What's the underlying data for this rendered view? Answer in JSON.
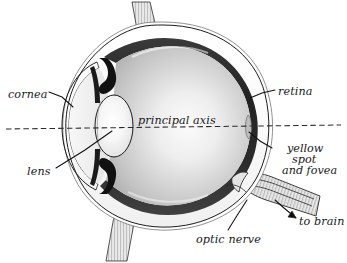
{
  "diagram": {
    "axis_label": "principal axis",
    "labels": {
      "cornea": "cornea",
      "lens": "lens",
      "retina": "retina",
      "yellow_spot_line1": "yellow",
      "yellow_spot_line2": "spot",
      "yellow_spot_line3": "and fovea",
      "optic_nerve": "optic nerve",
      "to_brain": "to brain"
    },
    "colors": {
      "background": "#ffffff",
      "outline": "#1d1d1d",
      "retina_dark": "#2a2a2a",
      "vitreous_light": "#f2f2f2",
      "vitreous_mid": "#c9c9c9",
      "sclera_white": "#ffffff",
      "muscle_stripe": "#d8d8d8",
      "iris_black": "#111111",
      "lens_light": "#fdfdfd",
      "text": "#1a1a1a"
    },
    "parts": [
      "cornea",
      "lens",
      "iris",
      "retina",
      "yellow spot and fovea",
      "optic nerve",
      "sclera",
      "vitreous humour",
      "eye muscle"
    ]
  }
}
